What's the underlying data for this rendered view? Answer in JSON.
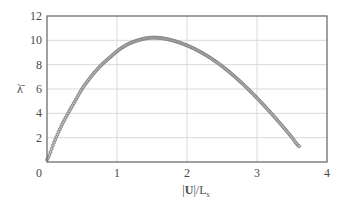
{
  "chart_data": {
    "type": "scatter",
    "title": "",
    "xlabel": "|U|/L_s",
    "xlabel_parts": {
      "bar_left": "|",
      "bold": "U",
      "bar_right": "|/L",
      "sub": "s"
    },
    "ylabel": "λ̄",
    "xlim": [
      0,
      4
    ],
    "ylim": [
      0,
      12
    ],
    "xticks": [
      0,
      1,
      2,
      3,
      4
    ],
    "yticks": [
      2,
      4,
      6,
      8,
      10,
      12
    ],
    "x_tick_labels": [
      "0",
      "1",
      "2",
      "3",
      "4"
    ],
    "y_tick_labels": [
      "2",
      "4",
      "6",
      "8",
      "10",
      "12"
    ],
    "grid": true,
    "legend": null,
    "series": [
      {
        "name": "λ̄",
        "marker": "small-circle",
        "color": "#7a7a7a",
        "x": [
          0.0,
          0.1,
          0.2,
          0.3,
          0.4,
          0.5,
          0.6,
          0.7,
          0.8,
          0.9,
          1.0,
          1.1,
          1.2,
          1.3,
          1.4,
          1.5,
          1.6,
          1.7,
          1.8,
          1.9,
          2.0,
          2.1,
          2.2,
          2.3,
          2.4,
          2.5,
          2.6,
          2.7,
          2.8,
          2.9,
          3.0,
          3.1,
          3.2,
          3.3,
          3.4,
          3.5,
          3.6
        ],
        "y": [
          0.2,
          1.6,
          2.9,
          4.0,
          5.0,
          6.0,
          6.8,
          7.5,
          8.1,
          8.6,
          9.1,
          9.5,
          9.8,
          10.0,
          10.15,
          10.22,
          10.2,
          10.12,
          9.98,
          9.8,
          9.58,
          9.32,
          9.02,
          8.68,
          8.3,
          7.88,
          7.42,
          6.92,
          6.4,
          5.84,
          5.26,
          4.65,
          4.02,
          3.37,
          2.7,
          2.01,
          1.3
        ]
      }
    ]
  }
}
